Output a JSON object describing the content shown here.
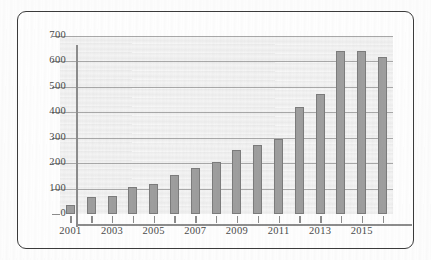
{
  "figure": {
    "frame_color": "#3b3b3b",
    "plot_background": "#ededed",
    "bar_color": "#9e9e9e",
    "bar_border_color": "#7c7c7c",
    "gridline_color": "#a8a8a8",
    "axis_color": "#8c8c8c"
  },
  "chart_data": {
    "type": "bar",
    "title": "",
    "subtitle": "",
    "xlabel": "",
    "ylabel": "",
    "categories": [
      "2001",
      "2002",
      "2003",
      "2004",
      "2005",
      "2006",
      "2007",
      "2008",
      "2009",
      "2010",
      "2011",
      "2012",
      "2013",
      "2014",
      "2015",
      "2016"
    ],
    "values": [
      35,
      65,
      70,
      105,
      118,
      155,
      182,
      205,
      250,
      272,
      296,
      420,
      473,
      640,
      640,
      618
    ],
    "ylim": [
      0,
      700
    ],
    "ytick_values": [
      0,
      100,
      200,
      300,
      400,
      500,
      600,
      700
    ],
    "ytick_labels": [
      "0",
      "100",
      "200",
      "300",
      "400",
      "500",
      "600",
      "700"
    ],
    "xtick_labels": [
      "2001",
      "",
      "2003",
      "",
      "2005",
      "",
      "2007",
      "",
      "2009",
      "",
      "2011",
      "",
      "2013",
      "",
      "2015",
      ""
    ],
    "xtick_visible_labels": [
      "2001",
      "2003",
      "2005",
      "2007",
      "2009",
      "2011",
      "2013",
      "2015"
    ],
    "grid": true,
    "grid_axis": "y",
    "legend": false,
    "legend_position": "none",
    "annotations": []
  }
}
